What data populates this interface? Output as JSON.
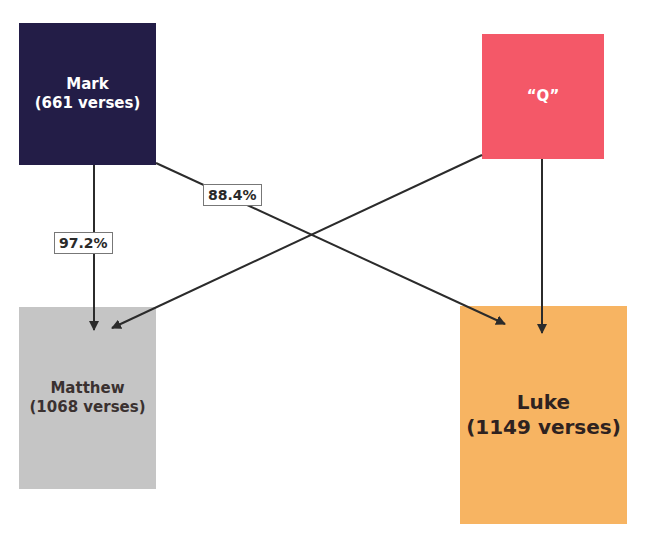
{
  "diagram": {
    "type": "flow",
    "title": "",
    "nodes": [
      {
        "id": "mark",
        "name": "Mark",
        "detail": "(661 verses)",
        "color": "#231d47"
      },
      {
        "id": "q",
        "name": "“Q”",
        "detail": "",
        "color": "#f45868"
      },
      {
        "id": "matthew",
        "name": "Matthew",
        "detail": "(1068 verses)",
        "color": "#c5c5c5"
      },
      {
        "id": "luke",
        "name": "Luke",
        "detail": "(1149 verses)",
        "color": "#f7b462"
      }
    ],
    "edges": [
      {
        "from": "mark",
        "to": "matthew",
        "label": "97.2%"
      },
      {
        "from": "mark",
        "to": "luke",
        "label": "88.4%"
      },
      {
        "from": "q",
        "to": "matthew",
        "label": ""
      },
      {
        "from": "q",
        "to": "luke",
        "label": ""
      }
    ],
    "edge_color": "#2b2b2b"
  }
}
